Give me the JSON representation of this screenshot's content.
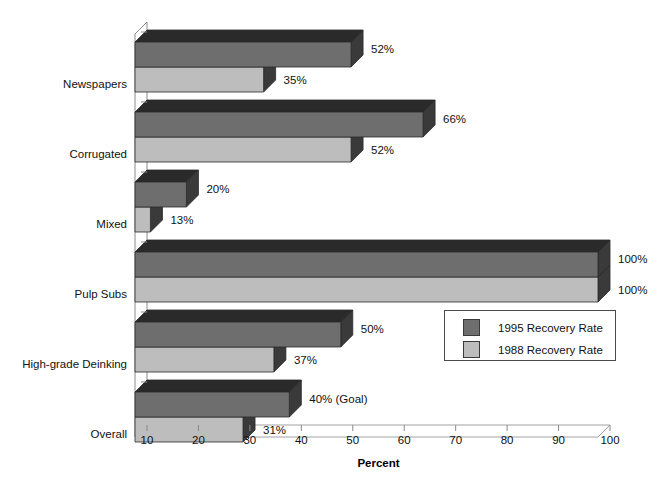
{
  "chart_data": {
    "type": "bar",
    "orientation": "horizontal",
    "style": "3d",
    "title": "",
    "xlabel": "Percent",
    "ylabel": "",
    "xlim": [
      10,
      100
    ],
    "xticks": [
      10,
      20,
      30,
      40,
      50,
      60,
      70,
      80,
      90,
      100
    ],
    "xticklabels": [
      "10",
      "20",
      "30",
      "40",
      "50",
      "60",
      "70",
      "80",
      "90",
      "100"
    ],
    "grid": false,
    "legend_position": "center-right",
    "categories": [
      "Newspapers",
      "Corrugated",
      "Mixed",
      "Pulp Subs",
      "High-grade Deinking",
      "Overall"
    ],
    "series": [
      {
        "name": "1995 Recovery Rate",
        "color": "#6e6e6e",
        "values": [
          52,
          66,
          20,
          100,
          50,
          40
        ],
        "labels": [
          "52%",
          "66%",
          "20%",
          "100%",
          "50%",
          "40%  (Goal)"
        ]
      },
      {
        "name": "1988 Recovery Rate",
        "color": "#bdbdbd",
        "values": [
          35,
          52,
          13,
          100,
          37,
          31
        ],
        "labels": [
          "35%",
          "52%",
          "13%",
          "100%",
          "37%",
          "31%"
        ]
      }
    ],
    "annotations": [
      "(Goal)"
    ]
  },
  "colors": {
    "series_1995_front": "#6e6e6e",
    "series_1995_top": "#2a2a2a",
    "series_1995_side": "#3a3a3a",
    "series_1988_front": "#bdbdbd",
    "series_1988_top": "#2a2a2a",
    "series_1988_side": "#3a3a3a",
    "axis": "#8a8a8a",
    "text": "#111111"
  },
  "legend": {
    "entries": [
      {
        "label": "1995 Recovery Rate",
        "swatch": "#6e6e6e"
      },
      {
        "label": "1988 Recovery Rate",
        "swatch": "#bdbdbd"
      }
    ]
  },
  "axis": {
    "title": "Percent"
  }
}
